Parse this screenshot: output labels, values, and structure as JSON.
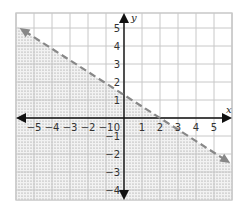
{
  "chart_data": {
    "type": "line",
    "title": "",
    "xlabel": "x",
    "ylabel": "y",
    "xlim": [
      -6,
      6
    ],
    "ylim": [
      -4.6,
      5.8
    ],
    "grid": true,
    "x_ticks": [
      "−5",
      "−4",
      "−3",
      "−2",
      "−1",
      "0",
      "1",
      "2",
      "3",
      "4",
      "5"
    ],
    "y_ticks": [
      "5",
      "4",
      "3",
      "2",
      "1",
      "−1",
      "−2",
      "−3",
      "−4"
    ],
    "series": [
      {
        "name": "boundary line (dashed)",
        "style": "dashed",
        "color": "#888888",
        "x": [
          -5.8,
          5.9
        ],
        "y": [
          5.0,
          -2.5
        ],
        "y_intercept": 1.5,
        "x_intercept": 2.5
      }
    ],
    "shaded_region": "below the dashed line",
    "shading_style": "dotted"
  },
  "colors": {
    "grid": "#c8c8c8",
    "axis": "#111111",
    "line": "#888888",
    "shade": "#9a9a9a"
  }
}
